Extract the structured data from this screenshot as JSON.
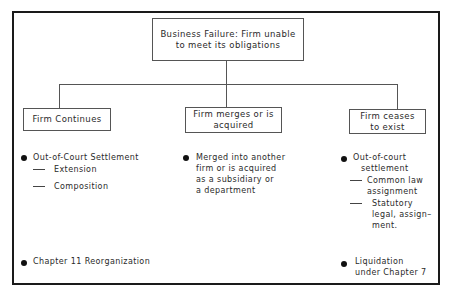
{
  "diagram": {
    "root": {
      "line1": "Business Failure: Firm unable",
      "line2": "to meet its obligations"
    },
    "branches": [
      {
        "title_line1": "Firm Continues",
        "bullets": [
          {
            "label": "Out-of-Court Settlement",
            "subitems": [
              "Extension",
              "Composition"
            ]
          },
          {
            "label": "Chapter 11 Reorganization"
          }
        ]
      },
      {
        "title_line1": "Firm merges or is",
        "title_line2": "acquired",
        "bullets": [
          {
            "lines": [
              "Merged into another",
              "firm or is acquired",
              "as a subsidiary or",
              "a department"
            ]
          }
        ]
      },
      {
        "title_line1": "Firm ceases",
        "title_line2": "to exist",
        "bullets": [
          {
            "lines": [
              "Out-of-court",
              "settlement"
            ],
            "subitems": [
              {
                "lines": [
                  "Common law",
                  "assignment"
                ]
              },
              {
                "lines": [
                  "Statutory",
                  "legal, assign–",
                  "ment."
                ]
              }
            ]
          },
          {
            "lines": [
              "Liquidation",
              "under Chapter 7"
            ]
          }
        ]
      }
    ]
  }
}
